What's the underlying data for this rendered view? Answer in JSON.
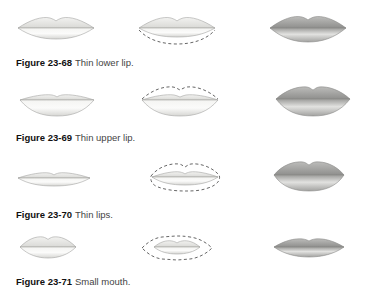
{
  "figures": [
    {
      "number": "Figure 23-68",
      "caption": "Thin lower lip.",
      "variant": "thin-lower"
    },
    {
      "number": "Figure 23-69",
      "caption": "Thin upper lip.",
      "variant": "thin-upper"
    },
    {
      "number": "Figure 23-70",
      "caption": "Thin lips.",
      "variant": "thin-both"
    },
    {
      "number": "Figure 23-71",
      "caption": "Small mouth.",
      "variant": "small"
    }
  ],
  "colors": {
    "bare_lip": "#e6e6e3",
    "bare_outline": "#9a9a98",
    "made_up_lip": "#a8a8a6",
    "dashed_guide": "#555555"
  }
}
